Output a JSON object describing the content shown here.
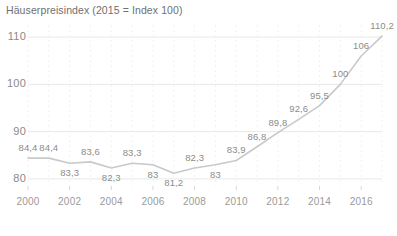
{
  "chart_data": {
    "type": "line",
    "title": "Häuserpreisindex (2015 = Index 100)",
    "xlabel": "",
    "ylabel": "",
    "x": [
      2000,
      2001,
      2002,
      2003,
      2004,
      2005,
      2006,
      2007,
      2008,
      2009,
      2010,
      2011,
      2012,
      2013,
      2014,
      2015,
      2016,
      2017
    ],
    "values": [
      84.4,
      84.4,
      83.3,
      83.6,
      82.3,
      83.3,
      83.0,
      81.2,
      82.3,
      83.0,
      83.9,
      86.8,
      89.8,
      92.6,
      95.5,
      100.0,
      106.0,
      110.2
    ],
    "point_labels": [
      "84,4",
      "84,4",
      "83,3",
      "83,6",
      "82,3",
      "83,3",
      "83",
      "81,2",
      "82,3",
      "83",
      "83,9",
      "86,8",
      "89,8",
      "92,6",
      "95,5",
      "100",
      "106",
      "110,2"
    ],
    "label_positions": [
      "above",
      "above",
      "below",
      "above",
      "below",
      "above",
      "below",
      "below",
      "above",
      "below",
      "above",
      "above",
      "above",
      "above",
      "above",
      "above",
      "above",
      "above"
    ],
    "ylim": [
      78.5,
      111.5
    ],
    "xlim": [
      2000,
      2017
    ],
    "yticks": [
      80,
      90,
      100,
      110
    ],
    "ytick_labels": [
      "80",
      "90",
      "100",
      "110"
    ],
    "xticks": [
      2000,
      2002,
      2004,
      2006,
      2008,
      2010,
      2012,
      2014,
      2016
    ],
    "xtick_labels": [
      "2000",
      "2002",
      "2004",
      "2006",
      "2008",
      "2010",
      "2012",
      "2014",
      "2016"
    ],
    "grid": "both-faint",
    "legend": "none",
    "series_color": "#c9c9c9",
    "text_color": "#8c8c8c",
    "grid_color": "#e8e8e8"
  }
}
